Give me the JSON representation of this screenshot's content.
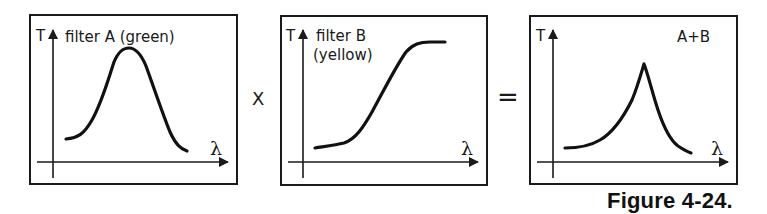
{
  "panels": [
    {
      "id": "filter-a",
      "title_line1": "filter A (green)",
      "title_line2": "",
      "y_axis_label": "T",
      "x_axis_label": "λ",
      "curve_shape": "bell (band-pass peak)"
    },
    {
      "id": "filter-b",
      "title_line1": "filter B",
      "title_line2": "(yellow)",
      "y_axis_label": "T",
      "x_axis_label": "λ",
      "curve_shape": "sigmoid rise (long-pass)"
    },
    {
      "id": "combined",
      "title_line1": "A+B",
      "title_line2": "",
      "y_axis_label": "T",
      "x_axis_label": "λ",
      "curve_shape": "narrow asymmetric peak"
    }
  ],
  "operators": {
    "multiply": "X",
    "equals": "="
  },
  "caption": "Figure 4-24."
}
